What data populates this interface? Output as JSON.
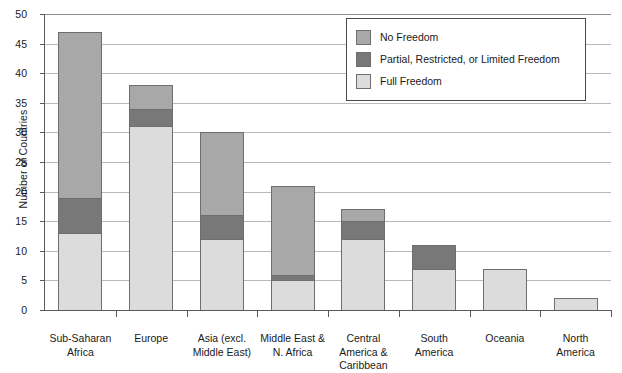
{
  "chart_data": {
    "type": "bar",
    "subtype": "stacked-vertical",
    "title": "",
    "xlabel": "",
    "ylabel": "Number of Countries",
    "ylim": [
      0,
      50
    ],
    "ytick_step": 5,
    "ytick_labels": [
      "0",
      "5",
      "10",
      "15",
      "20",
      "25",
      "30",
      "35",
      "40",
      "45",
      "50"
    ],
    "grid": "horizontal",
    "legend_position": "top-right-inside",
    "categories": [
      "Sub-Saharan Africa",
      "Europe",
      "Asia (excl. Middle East)",
      "Middle East & N. Africa",
      "Central America & Caribbean",
      "South America",
      "Oceania",
      "North America"
    ],
    "category_lines": [
      [
        "Sub-Saharan",
        "Africa"
      ],
      [
        "Europe"
      ],
      [
        "Asia (excl.",
        "Middle East)"
      ],
      [
        "Middle East &",
        "N. Africa"
      ],
      [
        "Central",
        "America &",
        "Caribbean"
      ],
      [
        "South",
        "America"
      ],
      [
        "Oceania"
      ],
      [
        "North",
        "America"
      ]
    ],
    "series": [
      {
        "name": "Full Freedom",
        "color": "#dcdcdc",
        "values": [
          13,
          31,
          12,
          5,
          12,
          7,
          7,
          2
        ]
      },
      {
        "name": "Partial, Restricted, or Limited Freedom",
        "color": "#787878",
        "values": [
          6,
          3,
          4,
          1,
          3,
          4,
          0,
          0
        ]
      },
      {
        "name": "No Freedom",
        "color": "#a8a8a8",
        "values": [
          28,
          4,
          14,
          15,
          2,
          0,
          0,
          0
        ]
      }
    ],
    "stack_order_bottom_to_top": [
      "Full Freedom",
      "Partial, Restricted, or Limited Freedom",
      "No Freedom"
    ],
    "totals": [
      47,
      38,
      30,
      21,
      17,
      11,
      7,
      2
    ]
  },
  "legend": {
    "entries": [
      {
        "label": "No Freedom",
        "color": "#a8a8a8"
      },
      {
        "label": "Partial, Restricted, or Limited Freedom",
        "color": "#787878"
      },
      {
        "label": "Full Freedom",
        "color": "#dcdcdc"
      }
    ]
  },
  "axis": {
    "y_title": "Number of Countries"
  }
}
